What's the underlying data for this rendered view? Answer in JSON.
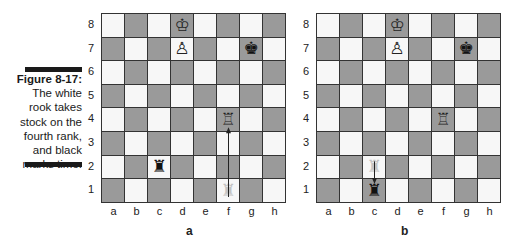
{
  "caption": {
    "figure_label": "Figure 8-17:",
    "lines": [
      "The white",
      "rook takes",
      "stock on the",
      "fourth rank,",
      "and black",
      "marks time."
    ]
  },
  "ranks": [
    "8",
    "7",
    "6",
    "5",
    "4",
    "3",
    "2",
    "1"
  ],
  "files": [
    "a",
    "b",
    "c",
    "d",
    "e",
    "f",
    "g",
    "h"
  ],
  "boards": [
    {
      "label": "a",
      "pieces": [
        {
          "square": "d8",
          "piece": "white-king",
          "glyph": "♔"
        },
        {
          "square": "d7",
          "piece": "white-pawn",
          "glyph": "♙"
        },
        {
          "square": "g7",
          "piece": "black-king",
          "glyph": "♚"
        },
        {
          "square": "f4",
          "piece": "white-rook",
          "glyph": "♖"
        },
        {
          "square": "c2",
          "piece": "black-rook",
          "glyph": "♜"
        },
        {
          "square": "f1",
          "piece": "white-rook-ghost",
          "glyph": "♜",
          "ghost": true
        }
      ],
      "arrow": {
        "from": "f1",
        "to": "f4"
      }
    },
    {
      "label": "b",
      "pieces": [
        {
          "square": "d8",
          "piece": "white-king",
          "glyph": "♔"
        },
        {
          "square": "d7",
          "piece": "white-pawn",
          "glyph": "♙"
        },
        {
          "square": "g7",
          "piece": "black-king",
          "glyph": "♚"
        },
        {
          "square": "f4",
          "piece": "white-rook",
          "glyph": "♖"
        },
        {
          "square": "c2",
          "piece": "black-rook-ghost",
          "glyph": "♜",
          "ghost": true
        },
        {
          "square": "c1",
          "piece": "black-rook",
          "glyph": "♜"
        }
      ],
      "arrow": {
        "from": "c2",
        "to": "c1"
      }
    }
  ],
  "colors": {
    "light_square": "#f7f7f7",
    "dark_square": "#9a9a9a",
    "border": "#333333"
  }
}
